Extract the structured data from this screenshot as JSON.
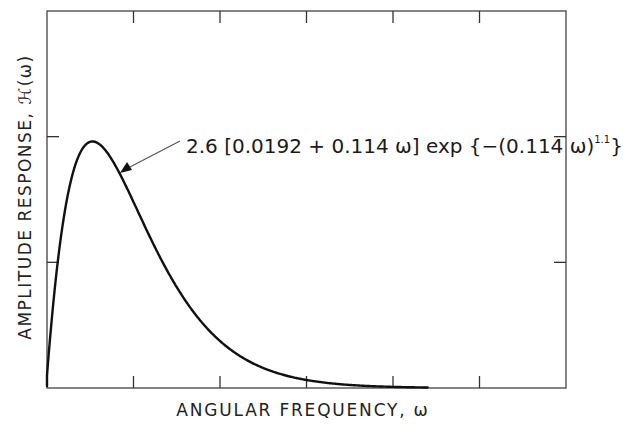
{
  "chart_data": {
    "type": "line",
    "title": "",
    "xlabel": "ANGULAR FREQUENCY, ω",
    "ylabel": "AMPLITUDE RESPONSE, ℋ(ω)",
    "xlim": [
      0,
      90
    ],
    "ylim": [
      0,
      1.5
    ],
    "x_ticks": [
      15,
      30,
      45,
      60,
      75
    ],
    "y_ticks": [
      0.5,
      1.0
    ],
    "tick_labels_shown": false,
    "grid": false,
    "legend": null,
    "annotation": {
      "text": "2.6 [0.0192 + 0.114 ω] exp {−(0.114 ω)^1.1}",
      "prefix": "2.6 [0.0192 + 0.114 ω] exp {−(0.114 ω)",
      "exponent": "1.1",
      "suffix": "}",
      "arrow_to": [
        9.5,
        0.86
      ]
    },
    "formula": {
      "scale": 2.6,
      "offset": 0.0192,
      "coef": 0.114,
      "power": 1.1
    },
    "series": [
      {
        "name": "H(ω)",
        "x": [
          0,
          1,
          2,
          3,
          4,
          5,
          6,
          7,
          8,
          9,
          10,
          12,
          14,
          16,
          18,
          20,
          22,
          24,
          26,
          28,
          30,
          33,
          36,
          40,
          45,
          50,
          55,
          60,
          66
        ],
        "values": [
          0.05,
          0.337,
          0.54,
          0.696,
          0.811,
          0.893,
          0.945,
          0.973,
          0.981,
          0.974,
          0.954,
          0.893,
          0.815,
          0.73,
          0.644,
          0.561,
          0.484,
          0.413,
          0.35,
          0.295,
          0.247,
          0.187,
          0.139,
          0.092,
          0.054,
          0.031,
          0.017,
          0.009,
          0.004
        ]
      }
    ]
  },
  "plot_area": {
    "left": 47,
    "top": 11,
    "right": 566,
    "bottom": 388
  }
}
